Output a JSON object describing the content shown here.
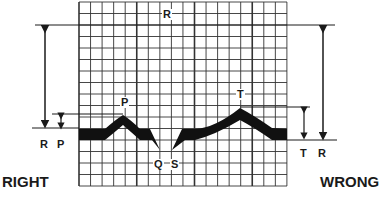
{
  "labels": {
    "peak_r": "R",
    "peak_p": "P",
    "peak_t": "T",
    "peak_q": "Q",
    "peak_s": "S",
    "left_r": "R",
    "left_p": "P",
    "right_t": "T",
    "right_r": "R",
    "right_caption": "RIGHT",
    "wrong_caption": "WRONG"
  },
  "colors": {
    "ink": "#1a1a1a",
    "grid": "#2a2a2a"
  }
}
